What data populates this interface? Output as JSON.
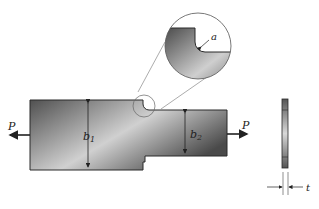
{
  "figure": {
    "labels": {
      "load_left": "P",
      "load_right": "P",
      "width_wide": "b",
      "width_wide_sub": "1",
      "width_narrow": "b",
      "width_narrow_sub": "2",
      "fillet_radius": "a",
      "thickness": "t"
    },
    "colors": {
      "plate_dark": "#555555",
      "plate_light": "#d8d8d8",
      "outline": "#2a2a2a",
      "leader_line": "#777777"
    }
  }
}
